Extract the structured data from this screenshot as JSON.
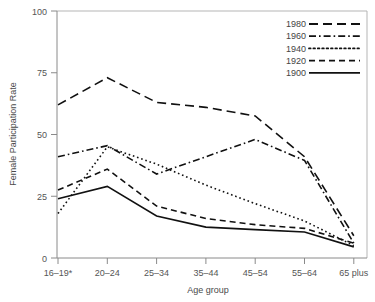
{
  "chart_data": {
    "type": "line",
    "title": "",
    "xlabel": "Age group",
    "ylabel": "Female Participation Rate",
    "categories": [
      "16–19*",
      "20–24",
      "25–34",
      "35–44",
      "45–54",
      "55–64",
      "65 plus"
    ],
    "ylim": [
      0,
      100
    ],
    "yticks": [
      0,
      25,
      50,
      75,
      100
    ],
    "ytick_labels": [
      "0",
      "25",
      "50",
      "75",
      "100"
    ],
    "grid": false,
    "legend_position": "top-right",
    "series": [
      {
        "name": "1980",
        "dash_style": "long-dash",
        "dash_array": "9,5",
        "values": [
          62,
          73,
          63,
          61,
          57.5,
          41,
          9
        ]
      },
      {
        "name": "1960",
        "dash_style": "dash-dot",
        "dash_array": "7,3,1.6,3",
        "values": [
          41,
          45.5,
          34,
          41,
          48,
          39.5,
          6
        ]
      },
      {
        "name": "1940",
        "dash_style": "dotted",
        "dash_array": "1.6,2.8",
        "values": [
          18,
          45,
          38,
          29.5,
          22,
          15,
          5
        ]
      },
      {
        "name": "1920",
        "dash_style": "dash",
        "dash_array": "6,4",
        "values": [
          27.5,
          36,
          21,
          16,
          13.5,
          12,
          6
        ]
      },
      {
        "name": "1900",
        "dash_style": "solid",
        "dash_array": "",
        "values": [
          24,
          29,
          17,
          12.5,
          11.5,
          10.5,
          4.5
        ]
      }
    ]
  },
  "legend": {
    "entries": [
      "1980",
      "1960",
      "1940",
      "1920",
      "1900"
    ]
  },
  "axes": {
    "y_title": "Female Participation Rate",
    "x_title": "Age group"
  },
  "colors": {
    "series_stroke": "#111111",
    "axis": "#8a8a8a",
    "text": "#555555",
    "background": "#ffffff"
  }
}
